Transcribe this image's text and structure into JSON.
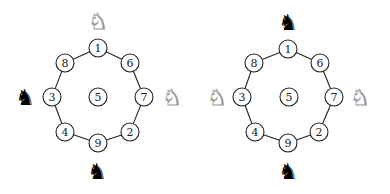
{
  "diagrams": [
    {
      "name": "left-position",
      "nodes": [
        {
          "label": "1",
          "x": 98,
          "y": 48
        },
        {
          "label": "6",
          "x": 130,
          "y": 63
        },
        {
          "label": "7",
          "x": 144,
          "y": 97
        },
        {
          "label": "2",
          "x": 130,
          "y": 132
        },
        {
          "label": "9",
          "x": 98,
          "y": 143
        },
        {
          "label": "4",
          "x": 65,
          "y": 132
        },
        {
          "label": "3",
          "x": 52,
          "y": 97
        },
        {
          "label": "8",
          "x": 65,
          "y": 63
        },
        {
          "label": "5",
          "x": 98,
          "y": 97
        }
      ],
      "knights": [
        {
          "color": "white",
          "glyph": "♞",
          "x": 98,
          "y": 21,
          "position": "top"
        },
        {
          "color": "white",
          "glyph": "♞",
          "x": 172,
          "y": 97,
          "position": "right"
        },
        {
          "color": "black",
          "glyph": "♞",
          "x": 25,
          "y": 97,
          "position": "left"
        },
        {
          "color": "black",
          "glyph": "♞",
          "x": 97,
          "y": 171,
          "position": "bottom"
        }
      ]
    },
    {
      "name": "right-position",
      "nodes": [
        {
          "label": "1",
          "x": 288,
          "y": 49
        },
        {
          "label": "6",
          "x": 320,
          "y": 63
        },
        {
          "label": "7",
          "x": 334,
          "y": 97
        },
        {
          "label": "2",
          "x": 319,
          "y": 132
        },
        {
          "label": "9",
          "x": 288,
          "y": 143
        },
        {
          "label": "4",
          "x": 255,
          "y": 132
        },
        {
          "label": "3",
          "x": 242,
          "y": 97
        },
        {
          "label": "8",
          "x": 254,
          "y": 63
        },
        {
          "label": "5",
          "x": 289,
          "y": 97
        }
      ],
      "knights": [
        {
          "color": "black",
          "glyph": "♞",
          "x": 288,
          "y": 22,
          "position": "top"
        },
        {
          "color": "white",
          "glyph": "♞",
          "x": 360,
          "y": 97,
          "position": "right"
        },
        {
          "color": "white",
          "glyph": "♞",
          "x": 217,
          "y": 97,
          "position": "left"
        },
        {
          "color": "black",
          "glyph": "♞",
          "x": 288,
          "y": 171,
          "position": "bottom"
        }
      ]
    }
  ],
  "ring_order": [
    "1",
    "6",
    "7",
    "2",
    "9",
    "4",
    "3",
    "8"
  ],
  "colors": {
    "stroke": "#222222",
    "black_piece": "#000000",
    "white_piece_outline": "#9a9a9a"
  }
}
